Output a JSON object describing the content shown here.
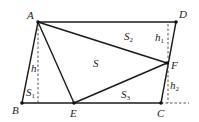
{
  "diagram": {
    "type": "geometry-figure",
    "points": {
      "A": {
        "label": "A",
        "x": 38,
        "y": 22
      },
      "D": {
        "label": "D",
        "x": 176,
        "y": 22
      },
      "B": {
        "label": "B",
        "x": 22,
        "y": 103
      },
      "E": {
        "label": "E",
        "x": 74,
        "y": 103
      },
      "C": {
        "label": "C",
        "x": 161,
        "y": 103
      },
      "F": {
        "label": "F",
        "x": 167,
        "y": 63
      }
    },
    "regions": {
      "S": "S",
      "S1": {
        "main": "S",
        "sub": "1"
      },
      "S2": {
        "main": "S",
        "sub": "2"
      },
      "S3": {
        "main": "S",
        "sub": "3"
      }
    },
    "heights": {
      "h": "h",
      "h1": {
        "main": "h",
        "sub": "1"
      },
      "h2": {
        "main": "h",
        "sub": "2"
      }
    }
  }
}
